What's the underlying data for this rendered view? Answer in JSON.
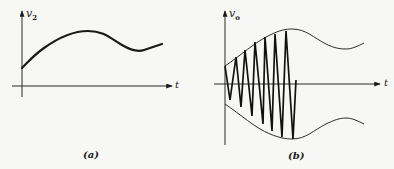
{
  "figure": {
    "panels": [
      {
        "id": "a",
        "caption": "(a)",
        "y_axis_label": {
          "symbol": "v",
          "subscript": "2"
        },
        "x_axis_label": "t",
        "curve_description": "smooth input signal rising from positive value to a maximum, dipping, then rising slightly"
      },
      {
        "id": "b",
        "caption": "(b)",
        "y_axis_label": {
          "symbol": "v",
          "subscript": "o"
        },
        "x_axis_label": "t",
        "curve_description": "amplitude-modulated triangular carrier between symmetric envelopes following v2"
      }
    ]
  },
  "colors": {
    "background": "#f7f7f5",
    "ink": "#1a1a1a"
  }
}
